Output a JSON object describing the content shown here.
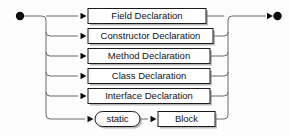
{
  "diagram": {
    "type": "railroad-syntax-diagram",
    "background_color": "#fdfdfd",
    "line_color": "#6b6b6b",
    "box_stroke_color": "#1a1a1a",
    "box_fill_color": "#ffffff",
    "shadow_color": "#b9b9b9",
    "marker_color": "#0d0d0d",
    "start_marker": "filled-circle",
    "end_marker": "arrowhead-filled-circle",
    "left_rail_x": 46,
    "right_rail_x": 228,
    "start_x": 20,
    "end_x": 278,
    "main_y": 16,
    "branches": [
      {
        "id": "field-declaration",
        "label": "Field Declaration",
        "shape": "rectangle",
        "y": 16,
        "box_x": 88,
        "box_width": 118,
        "box_height": 15,
        "arrow_x": 82
      },
      {
        "id": "constructor-declaration",
        "label": "Constructor Declaration",
        "shape": "rectangle",
        "y": 36,
        "box_x": 88,
        "box_width": 125,
        "box_height": 15,
        "arrow_x": 82
      },
      {
        "id": "method-declaration",
        "label": "Method Declaration",
        "shape": "rectangle",
        "y": 56,
        "box_x": 88,
        "box_width": 122,
        "box_height": 15,
        "arrow_x": 82
      },
      {
        "id": "class-declaration",
        "label": "Class Declaration",
        "shape": "rectangle",
        "y": 76,
        "box_x": 88,
        "box_width": 122,
        "box_height": 15,
        "arrow_x": 82
      },
      {
        "id": "interface-declaration",
        "label": "Interface Declaration",
        "shape": "rectangle",
        "y": 96,
        "box_x": 88,
        "box_width": 122,
        "box_height": 15,
        "arrow_x": 82
      }
    ],
    "static_block_row": {
      "id": "static-block",
      "y": 119,
      "terminal": {
        "id": "static-terminal",
        "label": "static",
        "shape": "stadium",
        "box_x": 95,
        "box_width": 45,
        "box_height": 15,
        "arrow_x": 89
      },
      "nonterminal": {
        "id": "block-nonterminal",
        "label": "Block",
        "shape": "rectangle",
        "box_x": 158,
        "box_width": 57,
        "box_height": 15,
        "arrow_x": 152
      }
    }
  }
}
